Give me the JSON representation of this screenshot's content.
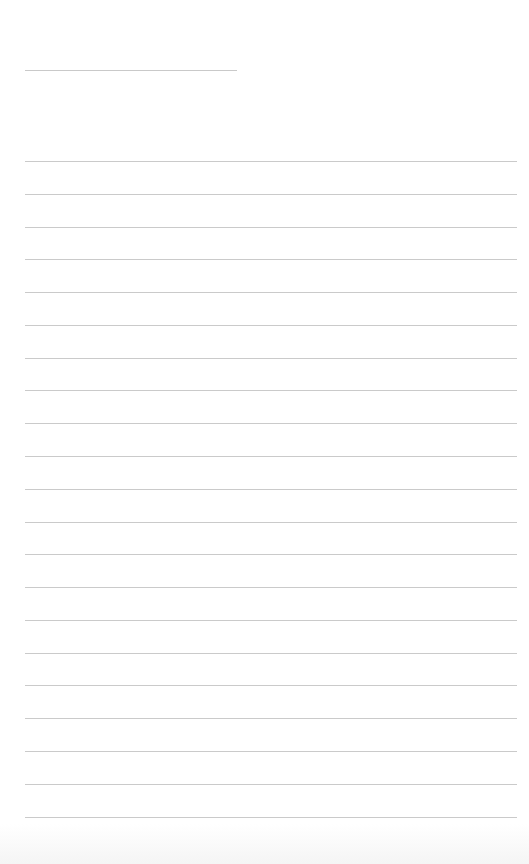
{
  "page": {
    "type": "lined-paper",
    "background": "#ffffff",
    "line_color": "#cacaca"
  },
  "title_line": {
    "label": "",
    "text": ""
  },
  "ruled_lines": [
    {
      "text": ""
    },
    {
      "text": ""
    },
    {
      "text": ""
    },
    {
      "text": ""
    },
    {
      "text": ""
    },
    {
      "text": ""
    },
    {
      "text": ""
    },
    {
      "text": ""
    },
    {
      "text": ""
    },
    {
      "text": ""
    },
    {
      "text": ""
    },
    {
      "text": ""
    },
    {
      "text": ""
    },
    {
      "text": ""
    },
    {
      "text": ""
    },
    {
      "text": ""
    },
    {
      "text": ""
    },
    {
      "text": ""
    },
    {
      "text": ""
    },
    {
      "text": ""
    },
    {
      "text": ""
    }
  ]
}
